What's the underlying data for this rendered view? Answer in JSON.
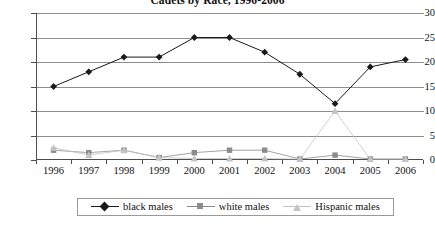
{
  "chart_data": {
    "type": "line",
    "title": "Cadets by Race, 1996-2006",
    "xlabel": "",
    "ylabel": "",
    "categories": [
      "1996",
      "1997",
      "1998",
      "1999",
      "2000",
      "2001",
      "2002",
      "2003",
      "2004",
      "2005",
      "2006"
    ],
    "ylim": [
      0,
      30
    ],
    "yticks": [
      "0",
      "5",
      "10",
      "15",
      "20",
      "25",
      "30"
    ],
    "grid": true,
    "legend_position": "bottom",
    "series": [
      {
        "name": "black males",
        "marker": "diamond",
        "color": "#1a1a1a",
        "values": [
          15,
          18,
          21,
          21,
          25,
          25,
          22,
          17.5,
          11.5,
          19,
          20.5
        ]
      },
      {
        "name": "white males",
        "marker": "square",
        "color": "#8c8c8c",
        "values": [
          2,
          1.5,
          2,
          0.5,
          1.5,
          2,
          2,
          0.2,
          1,
          0.2,
          0.2
        ]
      },
      {
        "name": "Hispanic males",
        "marker": "triangle",
        "color": "#c4c4c4",
        "values": [
          2.5,
          1,
          2,
          0.5,
          0.3,
          0.3,
          0.3,
          0.2,
          10,
          0.2,
          0.2
        ]
      }
    ]
  }
}
